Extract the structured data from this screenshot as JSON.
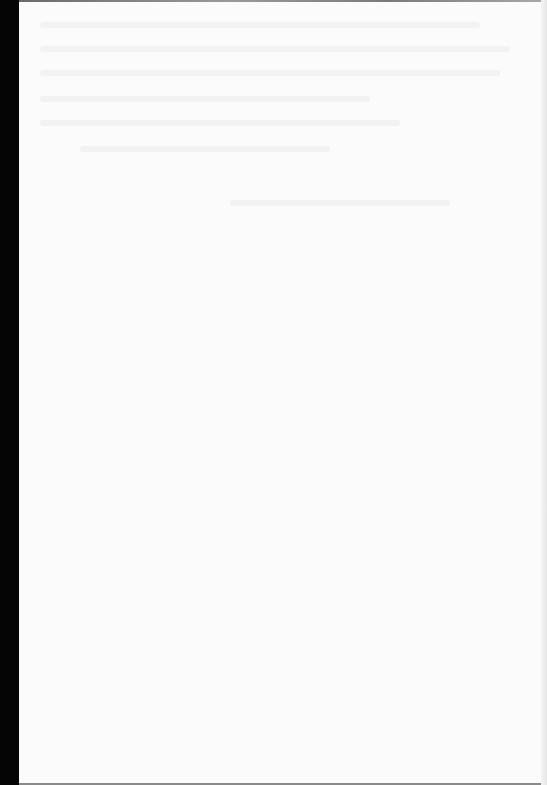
{
  "document": {
    "type": "scanned-page",
    "content_legible": false,
    "colors": {
      "paper": "#fbfbfb",
      "scan_border": "#050505",
      "bleed_through": "#f2f2f2"
    }
  }
}
